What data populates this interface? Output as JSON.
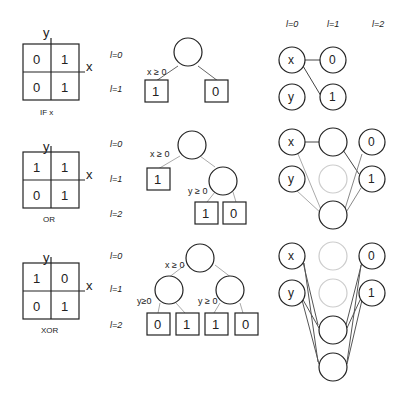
{
  "panels": [
    {
      "caption": "IF x",
      "grid": {
        "top_left": "0",
        "top_right": "1",
        "bottom_left": "0",
        "bottom_right": "1"
      },
      "axis_x": "x",
      "axis_y": "y",
      "levels": [
        "l=0",
        "l=1"
      ],
      "tree": {
        "root_condition": "x ≥ 0",
        "leaves": [
          "1",
          "0"
        ]
      },
      "network": {
        "inputs": [
          "x",
          "y"
        ],
        "outputs": [
          "0",
          "1"
        ]
      }
    },
    {
      "caption": "OR",
      "grid": {
        "top_left": "1",
        "top_right": "1",
        "bottom_left": "0",
        "bottom_right": "1"
      },
      "axis_x": "x",
      "axis_y": "y",
      "levels": [
        "l=0",
        "l=1",
        "l=2"
      ],
      "tree": {
        "root_condition": "x ≥ 0",
        "child_condition": "y ≥ 0",
        "leaves": [
          "1",
          "1",
          "0"
        ]
      },
      "network": {
        "inputs": [
          "x",
          "y"
        ],
        "outputs": [
          "0",
          "1"
        ]
      }
    },
    {
      "caption": "XOR",
      "grid": {
        "top_left": "1",
        "top_right": "0",
        "bottom_left": "0",
        "bottom_right": "1"
      },
      "axis_x": "x",
      "axis_y": "y",
      "levels": [
        "l=0",
        "l=1",
        "l=2"
      ],
      "tree": {
        "root_condition": "x ≥ 0",
        "left_condition": "y≥0",
        "right_condition": "y ≥ 0",
        "leaves": [
          "0",
          "1",
          "1",
          "0"
        ]
      },
      "network": {
        "inputs": [
          "x",
          "y"
        ],
        "outputs": [
          "0",
          "1"
        ]
      }
    }
  ],
  "network_header": [
    "l=0",
    "l=1",
    "l=2"
  ],
  "colors": {
    "stroke": "#222222",
    "faded": "#cccccc",
    "edge_light": "#aaaaaa"
  }
}
